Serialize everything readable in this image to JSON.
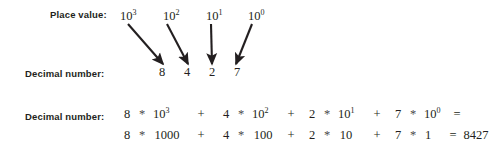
{
  "figure": {
    "background_color": "#ffffff",
    "ink_color": "#231f20",
    "labels": {
      "place_value": "Place value:",
      "decimal_number": "Decimal number:",
      "decimal_number_expansion": "Decimal number:"
    },
    "place_values": [
      {
        "base": "10",
        "exponent": "3"
      },
      {
        "base": "10",
        "exponent": "2"
      },
      {
        "base": "10",
        "exponent": "1"
      },
      {
        "base": "10",
        "exponent": "0"
      }
    ],
    "digits": [
      "8",
      "4",
      "2",
      "7"
    ],
    "arrows": [
      {
        "from_x": 128,
        "from_y": 24,
        "to_x": 163,
        "to_y": 64,
        "name": "arrow-10e3-to-8"
      },
      {
        "from_x": 167,
        "from_y": 24,
        "to_x": 188,
        "to_y": 64,
        "name": "arrow-10e2-to-4"
      },
      {
        "from_x": 211,
        "from_y": 24,
        "to_x": 212,
        "to_y": 64,
        "name": "arrow-10e1-to-2"
      },
      {
        "from_x": 252,
        "from_y": 24,
        "to_x": 236,
        "to_y": 64,
        "name": "arrow-10e0-to-7"
      }
    ],
    "expansion_line_1": {
      "terms": [
        {
          "coefficient": "8",
          "operator": "*",
          "base": "10",
          "exponent": "3"
        },
        {
          "coefficient": "4",
          "operator": "*",
          "base": "10",
          "exponent": "2"
        },
        {
          "coefficient": "2",
          "operator": "*",
          "base": "10",
          "exponent": "1"
        },
        {
          "coefficient": "7",
          "operator": "*",
          "base": "10",
          "exponent": "0"
        }
      ],
      "plus": "+",
      "equals": "="
    },
    "expansion_line_2": {
      "terms": [
        {
          "coefficient": "8",
          "operator": "*",
          "value": "1000"
        },
        {
          "coefficient": "4",
          "operator": "*",
          "value": "100"
        },
        {
          "coefficient": "2",
          "operator": "*",
          "value": "10"
        },
        {
          "coefficient": "7",
          "operator": "*",
          "value": "1"
        }
      ],
      "plus": "+",
      "equals": "=",
      "result": "8427"
    }
  }
}
